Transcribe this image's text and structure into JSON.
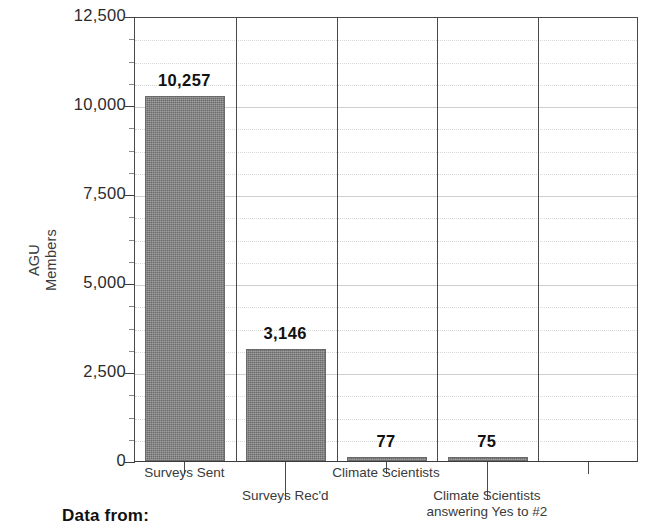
{
  "chart_data": {
    "type": "bar",
    "title": "",
    "xlabel": "",
    "ylabel": "AGU Members",
    "ylabel_lines": [
      "AGU",
      "Members"
    ],
    "categories": [
      "Surveys Sent",
      "Surveys Rec'd",
      "Climate Scientists",
      "Climate Scientists answering Yes to #2",
      ""
    ],
    "category_label_lines": [
      [
        "Surveys Sent"
      ],
      [
        "Surveys Rec'd"
      ],
      [
        "Climate Scientists"
      ],
      [
        "Climate Scientists",
        "answering Yes to #2"
      ],
      [
        ""
      ]
    ],
    "values": [
      10257,
      3146,
      77,
      75,
      null
    ],
    "value_labels": [
      "10,257",
      "3,146",
      "77",
      "75",
      ""
    ],
    "ylim": [
      0,
      12500
    ],
    "ytick_values": [
      0,
      2500,
      5000,
      7500,
      10000,
      12500
    ],
    "ytick_labels": [
      "0",
      "2,500",
      "5,000",
      "7,500",
      "10,000",
      "12,500"
    ],
    "minor_tick_step": 625,
    "grid": true,
    "legend": false,
    "bar_color": "#7b7b7b",
    "axis_color": "#4a4a4a",
    "grid_color": "#d4d4d4"
  },
  "footer": {
    "data_from_label": "Data from:"
  }
}
